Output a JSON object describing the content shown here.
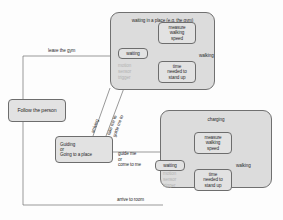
{
  "diagram": {
    "background_color": "#fdfdfd",
    "group_fill": "#dcdcdc",
    "node_fill": "#e2e2e2",
    "stroke_color": "#6d6d6d",
    "faded_text_color": "#b3b3b3"
  },
  "left_nodes": [
    {
      "id": "follow",
      "label": "Follow the person"
    },
    {
      "id": "guiding",
      "label": "Guiding\nor\nGoing to a place"
    }
  ],
  "groups": [
    {
      "id": "gym",
      "title": "waiting in a place (e.g. the gym)",
      "nodes": [
        {
          "id": "gym-waiting",
          "label": "waiting"
        },
        {
          "id": "gym-measure",
          "label": "measure\nwalking\nspeed"
        },
        {
          "id": "gym-standup",
          "label": "time\nneeded to\nstand up"
        }
      ],
      "faded_trigger": "motion\nsensor\ntrigger",
      "edge_label": "walking"
    },
    {
      "id": "charging",
      "title": "charging",
      "nodes": [
        {
          "id": "chg-waiting",
          "label": "waiting"
        },
        {
          "id": "chg-measure",
          "label": "measure\nwalking\nspeed"
        },
        {
          "id": "chg-standup",
          "label": "time\nneeded to\nstand up"
        }
      ],
      "faded_trigger": "motion\nsensor\ntrigger",
      "edge_label": "walking"
    }
  ],
  "edge_labels": [
    {
      "id": "leave-gym",
      "text": "leave the gym"
    },
    {
      "id": "arrive-room",
      "text": "arrive to room"
    },
    {
      "id": "guide-me",
      "text": "guide me\nor\ncome to me"
    },
    {
      "id": "arriving",
      "text": "arriving"
    },
    {
      "id": "take-me-to",
      "text": "take me to\nguide me to"
    }
  ]
}
